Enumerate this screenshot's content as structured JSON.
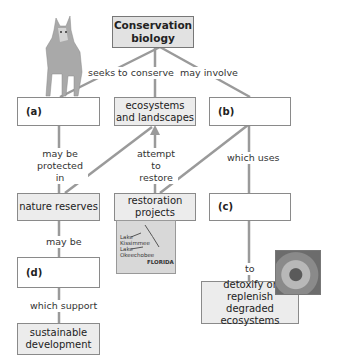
{
  "diagram": {
    "title_node": "Conservation biology",
    "nodes": {
      "a": "(a)",
      "ecosystems": "ecosystems and landscapes",
      "b": "(b)",
      "nature_reserves": "nature reserves",
      "restoration": "restoration projects",
      "c": "(c)",
      "d": "(d)",
      "sustainable": "sustainable development",
      "detoxify": "detoxify or replenish degraded ecosystems"
    },
    "links": {
      "seeks_to_conserve": "seeks to conserve",
      "may_involve": "may involve",
      "may_be_protected_in": "may be protected in",
      "attempt_to_restore": "attempt to restore",
      "which_uses": "which uses",
      "may_be": "may be",
      "to": "to",
      "which_support": "which support"
    },
    "map": {
      "lake1": "Lake Kissimmee",
      "lake2": "Lake Okeechobee",
      "state": "FLORIDA"
    },
    "colors": {
      "line": "#9a9a9a",
      "grey_box": "#ececec",
      "title_box": "#e2e2e2"
    }
  }
}
